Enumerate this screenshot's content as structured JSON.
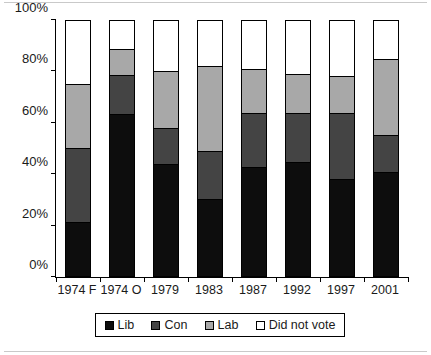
{
  "chart_data": {
    "type": "bar",
    "stacked": true,
    "stack_mode": "percent",
    "title": "",
    "xlabel": "",
    "ylabel": "",
    "ylim": [
      0,
      100
    ],
    "yticks": [
      0,
      20,
      40,
      60,
      80,
      100
    ],
    "ytick_labels": [
      "0%",
      "20%",
      "40%",
      "60%",
      "80%",
      "100%"
    ],
    "grid": false,
    "legend_position": "bottom",
    "categories": [
      "1974 F",
      "1974 O",
      "1979",
      "1983",
      "1987",
      "1992",
      "1997",
      "2001"
    ],
    "series": [
      {
        "name": "Lib",
        "color": "#0d0d0d",
        "values": [
          21,
          64,
          44,
          30,
          43,
          45,
          38,
          41
        ]
      },
      {
        "name": "Con",
        "color": "#444444",
        "values": [
          29,
          15,
          14,
          19,
          21,
          19,
          26,
          14
        ]
      },
      {
        "name": "Lab",
        "color": "#a8a8a8",
        "values": [
          25,
          10,
          22,
          33,
          17,
          15,
          14,
          30
        ]
      },
      {
        "name": "Did not vote",
        "color": "#ffffff",
        "values": [
          25,
          11,
          20,
          18,
          19,
          21,
          22,
          15
        ]
      }
    ],
    "cumulative_tops": {
      "Lib": [
        21,
        64,
        44,
        30,
        43,
        45,
        38,
        41
      ],
      "Con": [
        50,
        79,
        58,
        49,
        64,
        64,
        64,
        55
      ],
      "Lab": [
        75,
        89,
        80,
        82,
        81,
        79,
        78,
        85
      ],
      "Did not vote": [
        100,
        100,
        100,
        100,
        100,
        100,
        100,
        100
      ]
    }
  },
  "legend": {
    "items": [
      {
        "label": "Lib"
      },
      {
        "label": "Con"
      },
      {
        "label": "Lab"
      },
      {
        "label": "Did not vote"
      }
    ]
  }
}
